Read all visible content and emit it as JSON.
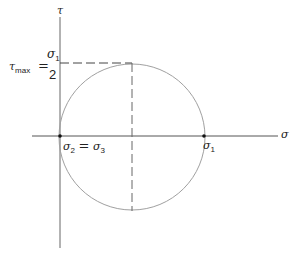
{
  "diagram": {
    "axes": {
      "horizontal_label": "σ",
      "vertical_label": "τ"
    },
    "labels": {
      "tau_max_symbol": "τ",
      "tau_max_sub": "max",
      "equals": "=",
      "fraction_numerator_symbol": "σ",
      "fraction_numerator_sub": "1",
      "fraction_denominator": "2",
      "origin_left_symbol": "σ",
      "origin_left_sub": "2",
      "origin_equals": "=",
      "origin_right_symbol": "σ",
      "origin_right_sub": "3",
      "right_point_symbol": "σ",
      "right_point_sub": "1"
    },
    "colors": {
      "axis": "#555555",
      "circle": "#9a9a9a",
      "dashed": "#444444",
      "point": "#111111"
    }
  }
}
